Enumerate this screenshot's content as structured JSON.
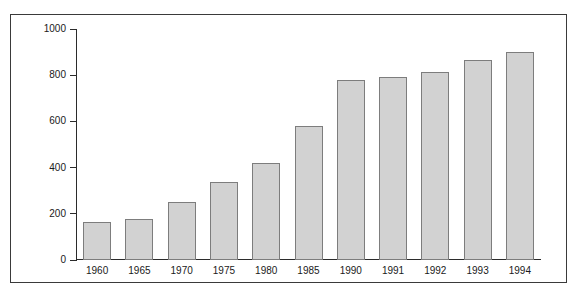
{
  "chart_data": {
    "type": "bar",
    "title": "",
    "subtitle": "",
    "xlabel": "",
    "ylabel": "",
    "categories": [
      "1960",
      "1965",
      "1970",
      "1975",
      "1980",
      "1985",
      "1990",
      "1991",
      "1992",
      "1993",
      "1994"
    ],
    "values": [
      163,
      178,
      250,
      338,
      420,
      580,
      780,
      793,
      815,
      868,
      900
    ],
    "series": [
      {
        "name": "",
        "values": [
          163,
          178,
          250,
          338,
          420,
          580,
          780,
          793,
          815,
          868,
          900
        ]
      }
    ],
    "ylim": [
      0,
      1000
    ],
    "ytick_labels": [
      "0",
      "200",
      "400",
      "600",
      "800",
      "1000"
    ],
    "ytick_values": [
      0,
      200,
      400,
      600,
      800,
      1000
    ],
    "grid": false,
    "legend": false,
    "legend_position": "none",
    "bar_color": "#d2d2d2",
    "bar_edge_color": "#7d7d7d",
    "axis_color": "#2b2b2b",
    "frame_color": "#3a3a3a",
    "background_color": "#ffffff",
    "annotations": []
  }
}
